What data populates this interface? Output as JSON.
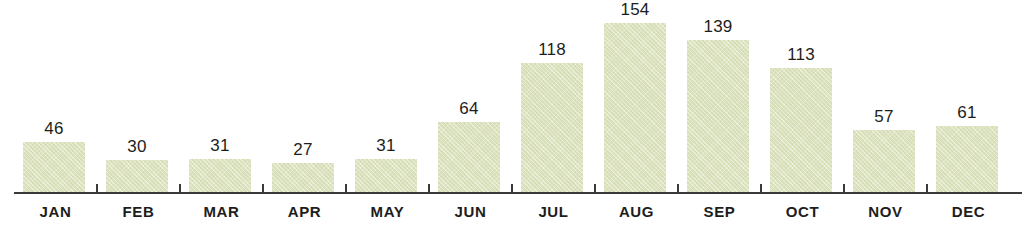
{
  "chart_data": {
    "type": "bar",
    "title": "",
    "subtitle": "",
    "xlabel": "",
    "ylabel": "",
    "categories": [
      "JAN",
      "FEB",
      "MAR",
      "APR",
      "MAY",
      "JUN",
      "JUL",
      "AUG",
      "SEP",
      "OCT",
      "NOV",
      "DEC"
    ],
    "values": [
      46,
      30,
      31,
      27,
      31,
      64,
      118,
      154,
      139,
      113,
      57,
      61
    ],
    "value_labels": [
      "46",
      "30",
      "31",
      "27",
      "31",
      "64",
      "118",
      "154",
      "139",
      "113",
      "57",
      "61"
    ],
    "ylim": [
      0,
      175
    ],
    "grid": false,
    "legend": null,
    "axis": {
      "x_axis_visible": true,
      "y_axis_visible": false,
      "tick_count": 11,
      "tick_position": "between-bars"
    },
    "annotations": "Each bar is labeled with its value above the bar."
  },
  "style": {
    "bar_fill": "#dde4bd",
    "axis_color": "#3a3a38",
    "label_color": "#1d1d1b",
    "background": "#ffffff"
  }
}
